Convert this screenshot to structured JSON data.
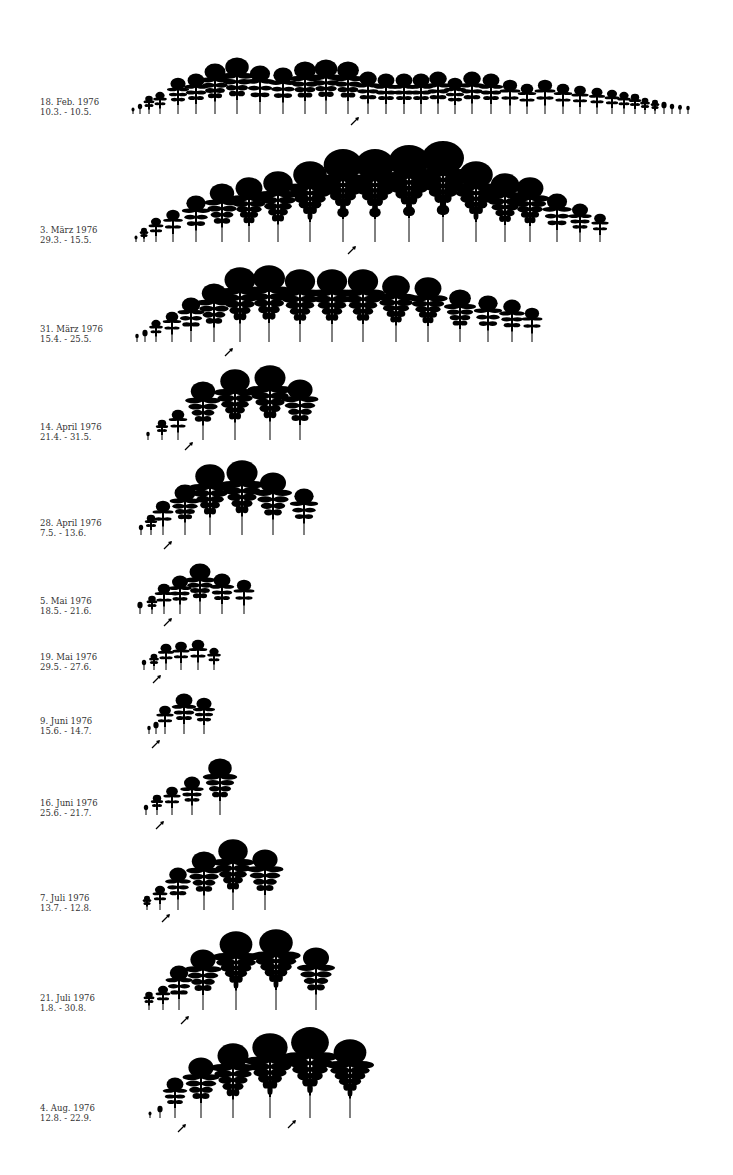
{
  "figure": {
    "leaf_color": "#000000",
    "background": "#ffffff"
  },
  "rows": [
    {
      "date": "18. Feb. 1976",
      "period": "10.3. - 10.5.",
      "label_y": 97,
      "base_y": 114,
      "leaves": [
        [
          133,
          6
        ],
        [
          140,
          10
        ],
        [
          149,
          18
        ],
        [
          160,
          22
        ],
        [
          178,
          36
        ],
        [
          196,
          40
        ],
        [
          215,
          50
        ],
        [
          237,
          56
        ],
        [
          260,
          48
        ],
        [
          283,
          46
        ],
        [
          305,
          52
        ],
        [
          326,
          54
        ],
        [
          348,
          52
        ],
        [
          368,
          42
        ],
        [
          386,
          40
        ],
        [
          404,
          40
        ],
        [
          421,
          40
        ],
        [
          438,
          42
        ],
        [
          455,
          36
        ],
        [
          472,
          42
        ],
        [
          491,
          40
        ],
        [
          510,
          34
        ],
        [
          527,
          30
        ],
        [
          545,
          34
        ],
        [
          563,
          30
        ],
        [
          580,
          28
        ],
        [
          597,
          26
        ],
        [
          612,
          24
        ],
        [
          624,
          22
        ],
        [
          635,
          20
        ],
        [
          645,
          16
        ],
        [
          655,
          14
        ],
        [
          664,
          12
        ],
        [
          672,
          10
        ],
        [
          680,
          9
        ],
        [
          688,
          8
        ]
      ],
      "arrows": [
        [
          355,
          121
        ]
      ]
    },
    {
      "date": "3. März 1976",
      "period": "29.3. - 15.5.",
      "label_y": 225,
      "base_y": 242,
      "leaves": [
        [
          136,
          6
        ],
        [
          144,
          14
        ],
        [
          156,
          24
        ],
        [
          173,
          32
        ],
        [
          196,
          46
        ],
        [
          222,
          58
        ],
        [
          249,
          64
        ],
        [
          278,
          70
        ],
        [
          310,
          80
        ],
        [
          343,
          92
        ],
        [
          375,
          92
        ],
        [
          409,
          96
        ],
        [
          443,
          100
        ],
        [
          476,
          80
        ],
        [
          505,
          68
        ],
        [
          530,
          64
        ],
        [
          557,
          48
        ],
        [
          580,
          38
        ],
        [
          600,
          28
        ]
      ],
      "arrows": [
        [
          352,
          250
        ]
      ]
    },
    {
      "date": "31. März 1976",
      "period": "15.4. - 25.5.",
      "label_y": 324,
      "base_y": 342,
      "leaves": [
        [
          137,
          8
        ],
        [
          145,
          12
        ],
        [
          156,
          22
        ],
        [
          172,
          30
        ],
        [
          191,
          44
        ],
        [
          214,
          58
        ],
        [
          240,
          74
        ],
        [
          269,
          76
        ],
        [
          300,
          72
        ],
        [
          332,
          72
        ],
        [
          363,
          72
        ],
        [
          396,
          66
        ],
        [
          428,
          64
        ],
        [
          460,
          52
        ],
        [
          488,
          46
        ],
        [
          512,
          42
        ],
        [
          532,
          34
        ]
      ],
      "arrows": [
        [
          229,
          352
        ]
      ]
    },
    {
      "date": "14. April 1976",
      "period": "21.4. - 31.5.",
      "label_y": 422,
      "base_y": 440,
      "leaves": [
        [
          148,
          8
        ],
        [
          162,
          20
        ],
        [
          178,
          30
        ],
        [
          203,
          58
        ],
        [
          235,
          70
        ],
        [
          270,
          74
        ],
        [
          300,
          60
        ]
      ],
      "arrows": [
        [
          189,
          446
        ]
      ]
    },
    {
      "date": "28. April 1976",
      "period": "7.5. - 13.6.",
      "label_y": 518,
      "base_y": 535,
      "leaves": [
        [
          141,
          10
        ],
        [
          151,
          20
        ],
        [
          163,
          34
        ],
        [
          185,
          50
        ],
        [
          210,
          70
        ],
        [
          242,
          74
        ],
        [
          273,
          62
        ],
        [
          304,
          46
        ]
      ],
      "arrows": [
        [
          168,
          545
        ]
      ]
    },
    {
      "date": "5. Mai 1976",
      "period": "18.5. - 21.6.",
      "label_y": 596,
      "base_y": 614,
      "leaves": [
        [
          140,
          12
        ],
        [
          152,
          18
        ],
        [
          164,
          30
        ],
        [
          180,
          38
        ],
        [
          200,
          50
        ],
        [
          222,
          40
        ],
        [
          244,
          34
        ]
      ],
      "arrows": [
        [
          168,
          622
        ]
      ]
    },
    {
      "date": "19. Mai 1976",
      "period": "29.5. - 27.6.",
      "label_y": 652,
      "base_y": 670,
      "leaves": [
        [
          144,
          10
        ],
        [
          154,
          16
        ],
        [
          166,
          26
        ],
        [
          181,
          28
        ],
        [
          198,
          30
        ],
        [
          214,
          22
        ]
      ],
      "arrows": [
        [
          157,
          679
        ]
      ]
    },
    {
      "date": "9. Juni 1976",
      "period": "15.6. - 14.7.",
      "label_y": 716,
      "base_y": 734,
      "leaves": [
        [
          149,
          8
        ],
        [
          156,
          12
        ],
        [
          165,
          28
        ],
        [
          184,
          40
        ],
        [
          204,
          36
        ]
      ],
      "arrows": [
        [
          156,
          744
        ]
      ]
    },
    {
      "date": "16. Juni 1976",
      "period": "25.6. - 21.7.",
      "label_y": 798,
      "base_y": 815,
      "leaves": [
        [
          146,
          10
        ],
        [
          157,
          20
        ],
        [
          172,
          28
        ],
        [
          192,
          38
        ],
        [
          220,
          56
        ]
      ],
      "arrows": [
        [
          160,
          825
        ]
      ]
    },
    {
      "date": "7. Juli 1976",
      "period": "13.7. - 12.8.",
      "label_y": 893,
      "base_y": 910,
      "leaves": [
        [
          147,
          14
        ],
        [
          160,
          24
        ],
        [
          178,
          42
        ],
        [
          204,
          58
        ],
        [
          233,
          70
        ],
        [
          265,
          60
        ]
      ],
      "arrows": [
        [
          166,
          918
        ]
      ]
    },
    {
      "date": "21. Juli 1976",
      "period": "1.8. - 30.8.",
      "label_y": 993,
      "base_y": 1010,
      "leaves": [
        [
          149,
          18
        ],
        [
          163,
          24
        ],
        [
          179,
          44
        ],
        [
          203,
          60
        ],
        [
          236,
          78
        ],
        [
          276,
          80
        ],
        [
          316,
          62
        ]
      ],
      "arrows": [
        [
          185,
          1020
        ]
      ]
    },
    {
      "date": "4. Aug. 1976",
      "period": "12.8. - 22.9.",
      "label_y": 1103,
      "base_y": 1118,
      "leaves": [
        [
          150,
          6
        ],
        [
          160,
          12
        ],
        [
          175,
          40
        ],
        [
          201,
          60
        ],
        [
          233,
          74
        ],
        [
          270,
          84
        ],
        [
          310,
          90
        ],
        [
          350,
          78
        ]
      ],
      "arrows": [
        [
          182,
          1128
        ],
        [
          292,
          1124
        ]
      ]
    }
  ]
}
